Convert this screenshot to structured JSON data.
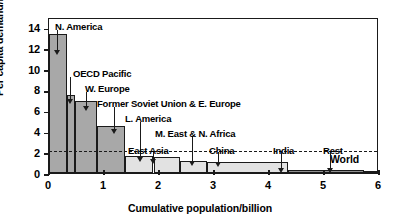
{
  "chart_data": {
    "type": "bar",
    "title": "",
    "xlabel": "Cumulative population/billion",
    "ylabel": "Per capita demand/MW h",
    "xlim": [
      0,
      6
    ],
    "ylim": [
      0,
      15
    ],
    "xticks": [
      "0",
      "1",
      "2",
      "3",
      "4",
      "5",
      "6"
    ],
    "yticks": [
      "0",
      "2",
      "4",
      "6",
      "8",
      "10",
      "12",
      "14"
    ],
    "grid": false,
    "legend": "none",
    "note": "Population-weighted bars: width = population (billion), height = per capita electricity demand (MW h)",
    "reference_line": {
      "label": "World",
      "value": 2.3,
      "style": "dashed"
    },
    "bars": [
      {
        "label": "N. America",
        "x0": 0.0,
        "x1": 0.33,
        "value": 13.4,
        "shade": "dark"
      },
      {
        "label": "OECD Pacific",
        "x0": 0.33,
        "x1": 0.48,
        "value": 7.5,
        "shade": "dark"
      },
      {
        "label": "W. Europe",
        "x0": 0.48,
        "x1": 0.88,
        "value": 6.9,
        "shade": "dark"
      },
      {
        "label": "Former Soviet Union & E. Europe",
        "x0": 0.88,
        "x1": 1.38,
        "value": 4.5,
        "shade": "dark"
      },
      {
        "label": "L. America",
        "x0": 1.38,
        "x1": 1.9,
        "value": 1.6,
        "shade": "light"
      },
      {
        "label": "East Asia",
        "x0": 1.9,
        "x1": 2.38,
        "value": 1.5,
        "shade": "light"
      },
      {
        "label": "M. East & N. Africa",
        "x0": 2.38,
        "x1": 2.88,
        "value": 1.2,
        "shade": "light"
      },
      {
        "label": "China",
        "x0": 2.88,
        "x1": 4.35,
        "value": 1.1,
        "shade": "light"
      },
      {
        "label": "India",
        "x0": 4.35,
        "x1": 5.72,
        "value": 0.3,
        "shade": "flat"
      },
      {
        "label": "Rest",
        "x0": 5.72,
        "x1": 6.0,
        "value": 0.2,
        "shade": "flat"
      }
    ],
    "annotations": [
      {
        "text": "N. America",
        "text_x": 55,
        "text_y": 22,
        "leader_x": 57,
        "leader_top": 30,
        "leader_bottom": 50
      },
      {
        "text": "OECD Pacific",
        "text_x": 73,
        "text_y": 69,
        "leader_x": 70,
        "leader_top": 77,
        "leader_bottom": 99
      },
      {
        "text": "W. Europe",
        "text_x": 85,
        "text_y": 84,
        "leader_x": 86,
        "leader_top": 92,
        "leader_bottom": 106
      },
      {
        "text": "Former Soviet Union & E. Europe",
        "text_x": 97,
        "text_y": 99,
        "leader_x": 114,
        "leader_top": 107,
        "leader_bottom": 129
      },
      {
        "text": "L. America",
        "text_x": 125,
        "text_y": 114,
        "leader_x": 140,
        "leader_top": 122,
        "leader_bottom": 157
      },
      {
        "text": "M. East & N. Africa",
        "text_x": 155,
        "text_y": 129,
        "leader_x": 192,
        "leader_top": 137,
        "leader_bottom": 161
      },
      {
        "text": "East Asia",
        "text_x": 128,
        "text_y": 146,
        "leader_x": 153,
        "leader_top": 152,
        "leader_bottom": 159
      },
      {
        "text": "China",
        "text_x": 209,
        "text_y": 146,
        "leader_x": 218,
        "leader_top": 152,
        "leader_bottom": 162
      },
      {
        "text": "India",
        "text_x": 273,
        "text_y": 146,
        "leader_x": 281,
        "leader_top": 152,
        "leader_bottom": 168
      },
      {
        "text": "Rest",
        "text_x": 323,
        "text_y": 146,
        "leader_x": 330,
        "leader_top": 152,
        "leader_bottom": 168
      }
    ]
  }
}
